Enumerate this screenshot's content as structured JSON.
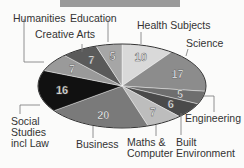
{
  "chart_data": {
    "type": "pie",
    "title": "",
    "slices": [
      {
        "label": "Health Subjects",
        "value": 10,
        "color": "#d9d9d9"
      },
      {
        "label": "Science",
        "value": 17,
        "color": "#8c8c8c"
      },
      {
        "label": "Engineering",
        "value": 5,
        "color": "#6e6e6e"
      },
      {
        "label": "Built Environment",
        "value": 6,
        "color": "#4a4a4a"
      },
      {
        "label": "Maths & Computer",
        "value": 7,
        "color": "#bdbdbd"
      },
      {
        "label": "Business",
        "value": 20,
        "color": "#7a7a7a"
      },
      {
        "label": "Social Studies incl Law",
        "value": 16,
        "color": "#111111"
      },
      {
        "label": "Humanities",
        "value": 7,
        "color": "#9a9a9a"
      },
      {
        "label": "Creative Arts",
        "value": 7,
        "color": "#5a5a5a"
      },
      {
        "label": "Education",
        "value": 5,
        "color": "#a6a6a6"
      }
    ],
    "total": 100
  },
  "labels": {
    "humanities": "Humanities",
    "education": "Education",
    "creative_arts": "Creative Arts",
    "health": "Health Subjects",
    "science": "Science",
    "engineering": "Engineering",
    "social_1": "Social",
    "social_2": "Studies",
    "social_3": "incl Law",
    "business": "Business",
    "maths_1": "Maths &",
    "maths_2": "Computer",
    "built_1": "Built",
    "built_2": "Environment"
  }
}
